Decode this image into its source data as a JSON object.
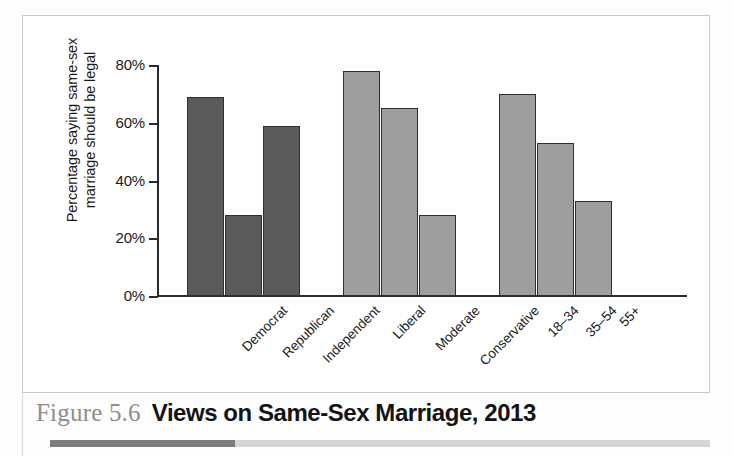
{
  "caption": {
    "figure_number": "Figure 5.6",
    "title": "Views on Same-Sex Marriage, 2013"
  },
  "chart_data": {
    "type": "bar",
    "title": "Views on Same-Sex Marriage, 2013",
    "xlabel": "",
    "ylabel": "Percentage saying same-sex marriage should be legal",
    "ylabel_line1": "Percentage saying same-sex",
    "ylabel_line2": "marriage should be legal",
    "ylim": [
      0,
      80
    ],
    "ytick_labels": [
      "0%",
      "20%",
      "40%",
      "60%",
      "80%"
    ],
    "ytick_values": [
      0,
      20,
      40,
      60,
      80
    ],
    "grid": false,
    "legend": "none",
    "categories": [
      "Democrat",
      "Republican",
      "Independent",
      "Liberal",
      "Moderate",
      "Conservative",
      "18–34",
      "35–54",
      "55+"
    ],
    "values": [
      69,
      28,
      59,
      78,
      65,
      28,
      70,
      53,
      33
    ],
    "groups": [
      {
        "name": "Party identification",
        "color": "#5a5a5a",
        "bars": [
          {
            "label": "Democrat",
            "value": 69
          },
          {
            "label": "Republican",
            "value": 28
          },
          {
            "label": "Independent",
            "value": 59
          }
        ]
      },
      {
        "name": "Ideology",
        "color": "#9e9e9e",
        "bars": [
          {
            "label": "Liberal",
            "value": 78
          },
          {
            "label": "Moderate",
            "value": 65
          },
          {
            "label": "Conservative",
            "value": 28
          }
        ]
      },
      {
        "name": "Age",
        "color": "#9e9e9e",
        "bars": [
          {
            "label": "18–34",
            "value": 70
          },
          {
            "label": "35–54",
            "value": 53
          },
          {
            "label": "55+",
            "value": 33
          }
        ]
      }
    ]
  },
  "colors": {
    "bar_dark": "#5a5a5a",
    "bar_light": "#9e9e9e",
    "bar_outline": "#2f2f2f",
    "axis": "#2b2b2b",
    "frame": "#c9c9c9",
    "caption_figno": "#8d8d8d",
    "caption_title": "#141414"
  }
}
